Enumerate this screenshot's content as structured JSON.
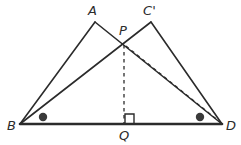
{
  "figure": {
    "type": "geometry-diagram",
    "width": 241,
    "height": 145,
    "background_color": "#ffffff",
    "stroke_color": "#2b2b2b",
    "labels": [
      {
        "id": "A",
        "text": "A",
        "x": 88,
        "y": 4
      },
      {
        "id": "Cp",
        "text": "C'",
        "x": 143,
        "y": 4
      },
      {
        "id": "P",
        "text": "P",
        "x": 119,
        "y": 24
      },
      {
        "id": "B",
        "text": "B",
        "x": 7,
        "y": 119
      },
      {
        "id": "D",
        "text": "D",
        "x": 226,
        "y": 119
      },
      {
        "id": "Q",
        "text": "Q",
        "x": 119,
        "y": 129
      }
    ],
    "points": {
      "A": {
        "x": 95,
        "y": 22
      },
      "Cp": {
        "x": 151,
        "y": 22
      },
      "P": {
        "x": 124,
        "y": 44
      },
      "B": {
        "x": 20,
        "y": 124
      },
      "D": {
        "x": 222,
        "y": 124
      },
      "Q": {
        "x": 124,
        "y": 124
      }
    },
    "segments": [
      {
        "name": "segment-B-A",
        "from": "B",
        "to": "A",
        "style": "solid",
        "width": 1.6
      },
      {
        "name": "segment-A-D",
        "from": "A",
        "to": "D",
        "style": "solid",
        "width": 1.6
      },
      {
        "name": "segment-B-Cp",
        "from": "B",
        "to": "Cp",
        "style": "solid",
        "width": 1.6
      },
      {
        "name": "segment-Cp-D",
        "from": "Cp",
        "to": "D",
        "style": "solid",
        "width": 1.6
      },
      {
        "name": "segment-B-D-base",
        "from": "B",
        "to": "D",
        "style": "solid",
        "width": 2.6
      },
      {
        "name": "segment-P-Q",
        "from": "P",
        "to": "Q",
        "style": "dashed",
        "width": 1.4
      },
      {
        "name": "segment-P-D",
        "from": "P",
        "to": "D",
        "style": "dashed",
        "width": 1.4
      }
    ],
    "angle_markers": [
      {
        "name": "angle-dot-at-B",
        "x": 43,
        "y": 117,
        "r": 4.2,
        "fill": "#3a3a3a"
      },
      {
        "name": "angle-dot-at-D",
        "x": 200,
        "y": 117,
        "r": 4.2,
        "fill": "#3a3a3a"
      }
    ],
    "right_angle_marker": {
      "name": "right-angle-at-Q",
      "path": "M 125,123 L 125,114 L 134,114 L 134,123",
      "size": 9
    }
  }
}
